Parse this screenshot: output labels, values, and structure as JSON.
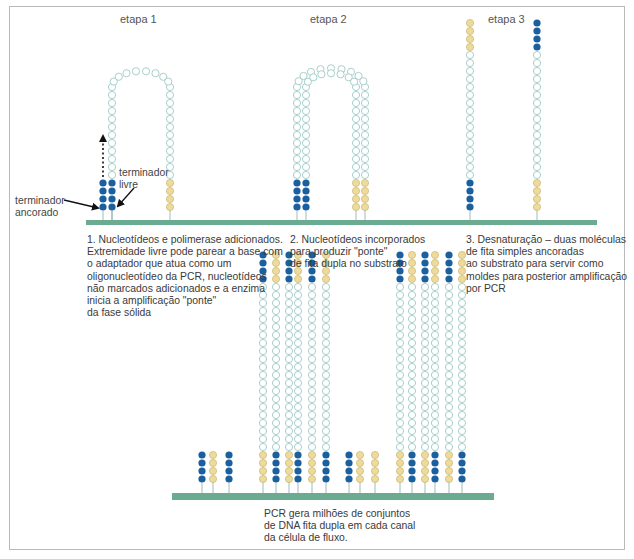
{
  "stages": [
    {
      "label": "etapa 1",
      "x": 120,
      "y": 13
    },
    {
      "label": "etapa 2",
      "x": 310,
      "y": 13
    },
    {
      "label": "etapa 3",
      "x": 488,
      "y": 13
    }
  ],
  "callouts": {
    "free_end": "terminador\nlivre",
    "anchored_end": "terminador\nancorado"
  },
  "captions": {
    "step1": "1. Nucleotídeos e polimerase adicionados.\nExtremidade livre pode parear a base com\no adaptador que atua como um\noligonucleotídeo da PCR, nucleotídeos\nnão marcados adicionados e a enzima\ninicia a amplificação \"ponte\"\nda fase sólida",
    "step2": "2. Nucleotídeos incorporados\npara produzir \"ponte\"\nde fita dupla no substrato",
    "step3": "3. Desnaturação – duas moléculas\nde fita simples ancoradas\nao substrato para servir como\nmoldes para posterior amplificação\npor PCR",
    "bottom": "PCR gera milhões de conjuntos\nde DNA fita dupla em cada canal\nda célula de fluxo."
  },
  "colors": {
    "substrate": "#6aab92",
    "adaptor_blue": "#1a5f9e",
    "adaptor_yellow": "#eedb9a",
    "adaptor_yellow_stroke": "#c9b877",
    "template_stroke": "#9fc9c4",
    "frame": "#b9b9b9",
    "text": "#3a3a3a"
  },
  "layout": {
    "top_substrate": {
      "x1": 86,
      "x2": 597,
      "y": 220,
      "h": 5
    },
    "bottom_substrate": {
      "x1": 172,
      "x2": 494,
      "y": 493,
      "h": 7
    },
    "bead_spacing": 8
  }
}
